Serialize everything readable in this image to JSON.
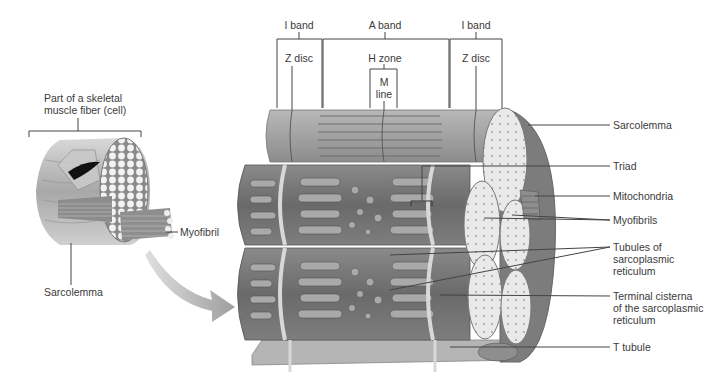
{
  "diagram": {
    "type": "anatomical-illustration",
    "colors": {
      "background": "#ffffff",
      "tissue_dark": "#6e6e6e",
      "tissue_mid": "#9a9a9a",
      "tissue_light": "#c8c8c8",
      "myofibril_end": "#e6e6e6",
      "leader_line": "#444444",
      "text": "#3a3a3a"
    },
    "left_panel": {
      "fiber_label": "Part of a skeletal muscle fiber (cell)",
      "fiber_label_line1": "Part of a skeletal",
      "fiber_label_line2": "muscle fiber (cell)",
      "myofibril_label": "Myofibril",
      "sarcolemma_label": "Sarcolemma"
    },
    "top_bands": {
      "i_band_left": "I band",
      "a_band": "A band",
      "i_band_right": "I band",
      "z_disc_left": "Z disc",
      "h_zone": "H zone",
      "m_line_1": "M",
      "m_line_2": "line",
      "z_disc_right": "Z disc"
    },
    "right_labels": [
      {
        "id": "sarcolemma",
        "text": "Sarcolemma"
      },
      {
        "id": "triad",
        "text": "Triad"
      },
      {
        "id": "mitochondria",
        "text": "Mitochondria"
      },
      {
        "id": "myofibrils",
        "text": "Myofibrils"
      },
      {
        "id": "tubules-sr",
        "line1": "Tubules of",
        "line2": "sarcoplasmic",
        "line3": "reticulum"
      },
      {
        "id": "terminal-cisterna",
        "line1": "Terminal cisterna",
        "line2": "of the sarcoplasmic",
        "line3": "reticulum"
      },
      {
        "id": "t-tubule",
        "text": "T tubule"
      }
    ]
  }
}
